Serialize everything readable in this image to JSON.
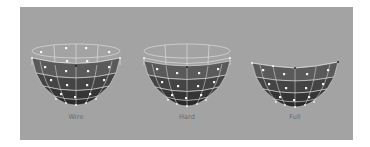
{
  "panel": {
    "background": "#a3a3a3"
  },
  "figures": [
    {
      "label": "Wire",
      "mode": "wire",
      "show_top_ring": true,
      "top_ring_style": "wireframe"
    },
    {
      "label": "Hard",
      "mode": "hard",
      "show_top_ring": true,
      "top_ring_style": "wireframe"
    },
    {
      "label": "Full",
      "mode": "full",
      "show_top_ring": false,
      "top_ring_style": "none"
    }
  ],
  "colors": {
    "wire_line": "#e6e6e6",
    "band_1": "#5a5a5a",
    "band_2": "#444444",
    "band_3": "#353535",
    "band_4": "#2a2a2a",
    "control_point": "#f4f4f4",
    "label_text": "#6a6a6a"
  }
}
